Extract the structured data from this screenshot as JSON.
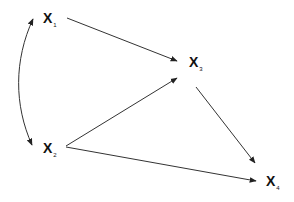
{
  "diagram": {
    "type": "directed-graph",
    "nodes": [
      {
        "id": "x1",
        "main": "X",
        "sub": "1",
        "x": 43,
        "y": 11
      },
      {
        "id": "x2",
        "main": "X",
        "sub": "2",
        "x": 43,
        "y": 141
      },
      {
        "id": "x3",
        "main": "X",
        "sub": "3",
        "x": 189,
        "y": 55
      },
      {
        "id": "x4",
        "main": "X",
        "sub": "4",
        "x": 266,
        "y": 174
      }
    ],
    "edges": [
      {
        "from": "x1",
        "to": "x2",
        "kind": "bidirected-curve"
      },
      {
        "from": "x1",
        "to": "x3",
        "kind": "directed"
      },
      {
        "from": "x2",
        "to": "x3",
        "kind": "directed"
      },
      {
        "from": "x2",
        "to": "x4",
        "kind": "directed"
      },
      {
        "from": "x3",
        "to": "x4",
        "kind": "directed"
      }
    ],
    "colors": {
      "line": "#333333",
      "text": "#111111",
      "background": "#ffffff"
    }
  }
}
